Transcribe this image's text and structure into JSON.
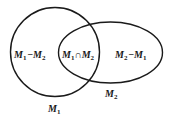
{
  "diagram": {
    "type": "venn",
    "colors": {
      "stroke": "#1a1a1a",
      "background": "#ffffff"
    },
    "sets": [
      {
        "id": "M1",
        "label_base": "M",
        "label_sub": "1",
        "shape": "circle"
      },
      {
        "id": "M2",
        "label_base": "M",
        "label_sub": "2",
        "shape": "ellipse"
      }
    ],
    "regions": {
      "left_only": {
        "a": "M",
        "a_sub": "1",
        "op": "−",
        "b": "M",
        "b_sub": "2"
      },
      "intersection": {
        "a": "M",
        "a_sub": "1",
        "op": "∩",
        "b": "M",
        "b_sub": "2"
      },
      "right_only": {
        "a": "M",
        "a_sub": "2",
        "op": "−",
        "b": "M",
        "b_sub": "1"
      }
    }
  }
}
